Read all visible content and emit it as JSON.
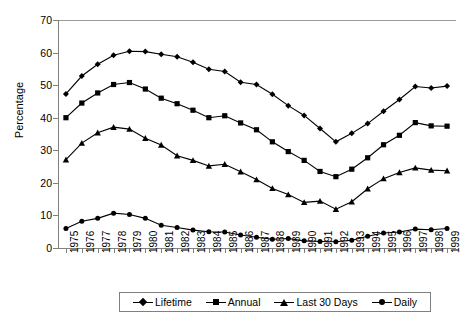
{
  "chart_data": {
    "type": "line",
    "title": "",
    "xlabel": "",
    "ylabel": "Percentage",
    "ylim": [
      0,
      70
    ],
    "ytick_step": 10,
    "yticks": [
      0,
      10,
      20,
      30,
      40,
      50,
      60,
      70
    ],
    "grid": false,
    "legend_position": "bottom",
    "categories": [
      "1975",
      "1976",
      "1977",
      "1978",
      "1979",
      "1980",
      "1981",
      "1982",
      "1983",
      "1984",
      "1985",
      "1986",
      "1987",
      "1988",
      "1989",
      "1990",
      "1991",
      "1992",
      "1993",
      "1994",
      "1995",
      "1996",
      "1997",
      "1998",
      "1999"
    ],
    "series": [
      {
        "name": "Lifetime",
        "marker": "diamond",
        "values": [
          47.3,
          52.8,
          56.4,
          59.2,
          60.4,
          60.3,
          59.5,
          58.7,
          57.0,
          54.9,
          54.2,
          50.9,
          50.2,
          47.2,
          43.7,
          40.7,
          36.7,
          32.6,
          35.2,
          38.2,
          42.0,
          45.6,
          49.6,
          49.1,
          49.7
        ]
      },
      {
        "name": "Annual",
        "marker": "square",
        "values": [
          40.0,
          44.5,
          47.6,
          50.2,
          50.8,
          48.8,
          46.0,
          44.3,
          42.3,
          40.0,
          40.6,
          38.4,
          36.3,
          32.6,
          29.6,
          26.9,
          23.5,
          21.9,
          24.2,
          27.7,
          31.7,
          34.6,
          38.5,
          37.5,
          37.4
        ]
      },
      {
        "name": "Last 30 Days",
        "marker": "triangle",
        "values": [
          27.1,
          32.2,
          35.4,
          37.1,
          36.5,
          33.7,
          31.6,
          28.3,
          26.9,
          25.2,
          25.7,
          23.4,
          21.0,
          18.3,
          16.4,
          14.0,
          14.4,
          11.9,
          14.2,
          18.2,
          21.3,
          23.2,
          24.6,
          23.9,
          23.7
        ]
      },
      {
        "name": "Daily",
        "marker": "circle",
        "values": [
          6.0,
          8.2,
          9.1,
          10.7,
          10.3,
          9.1,
          7.0,
          6.3,
          5.5,
          5.0,
          4.9,
          4.0,
          3.3,
          2.7,
          2.9,
          2.2,
          2.0,
          1.9,
          2.4,
          3.6,
          4.6,
          4.9,
          5.8,
          5.6,
          6.0
        ]
      }
    ]
  },
  "legend": {
    "items": [
      {
        "label": "Lifetime",
        "marker": "diamond"
      },
      {
        "label": "Annual",
        "marker": "square"
      },
      {
        "label": "Last 30 Days",
        "marker": "triangle"
      },
      {
        "label": "Daily",
        "marker": "circle"
      }
    ]
  },
  "colors": {
    "series": "#000000",
    "axis": "#808080",
    "background": "#ffffff"
  }
}
